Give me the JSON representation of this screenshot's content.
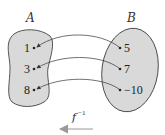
{
  "diagram": {
    "set_a": {
      "label": "A",
      "elements": [
        "1",
        "3",
        "8"
      ],
      "fill": "#d9d9d9"
    },
    "set_b": {
      "label": "B",
      "elements": [
        "5",
        "7",
        "−10"
      ],
      "fill": "#d9d9d9"
    },
    "mappings": [
      {
        "from": "5",
        "to": "1"
      },
      {
        "from": "7",
        "to": "3"
      },
      {
        "from": "−10",
        "to": "8"
      }
    ],
    "function_label": {
      "base": "f",
      "superscript": "−1"
    },
    "direction_arrow": "right-to-left",
    "arrow_color": "#aaaaaa"
  }
}
